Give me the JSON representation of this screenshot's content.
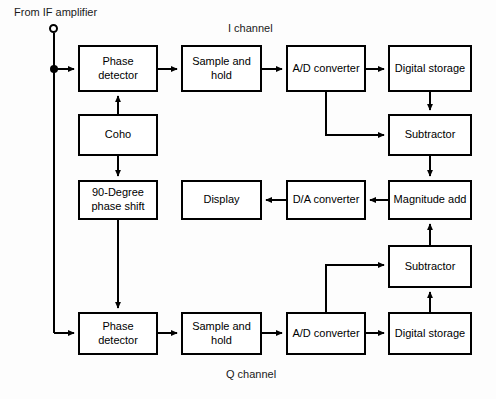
{
  "diagram": {
    "background_color": "#fdfdfd",
    "line_color": "#000000",
    "box_fill": "#ffffff",
    "text_color": "#000000",
    "source_label": "From IF amplifier",
    "channel_labels": {
      "i_channel": "I channel",
      "q_channel": "Q channel"
    },
    "nodes": [
      {
        "id": "phase_detector_i",
        "label": "Phase\ndetector",
        "x": 78,
        "y": 45,
        "w": 80,
        "h": 47
      },
      {
        "id": "sample_hold_i",
        "label": "Sample and\nhold",
        "x": 181,
        "y": 45,
        "w": 81,
        "h": 47
      },
      {
        "id": "ad_converter_i",
        "label": "A/D converter",
        "x": 286,
        "y": 45,
        "w": 80,
        "h": 47
      },
      {
        "id": "digital_storage_i",
        "label": "Digital storage",
        "x": 388,
        "y": 45,
        "w": 84,
        "h": 47
      },
      {
        "id": "coho",
        "label": "Coho",
        "x": 78,
        "y": 114,
        "w": 80,
        "h": 42
      },
      {
        "id": "subtractor_i",
        "label": "Subtractor",
        "x": 388,
        "y": 114,
        "w": 84,
        "h": 42
      },
      {
        "id": "phase_shift_90",
        "label": "90-Degree\nphase shift",
        "x": 78,
        "y": 180,
        "w": 80,
        "h": 40
      },
      {
        "id": "display",
        "label": "Display",
        "x": 181,
        "y": 180,
        "w": 81,
        "h": 40
      },
      {
        "id": "da_converter",
        "label": "D/A converter",
        "x": 286,
        "y": 180,
        "w": 80,
        "h": 40
      },
      {
        "id": "magnitude_add",
        "label": "Magnitude add",
        "x": 388,
        "y": 180,
        "w": 84,
        "h": 40
      },
      {
        "id": "subtractor_q",
        "label": "Subtractor",
        "x": 388,
        "y": 245,
        "w": 84,
        "h": 43
      },
      {
        "id": "phase_detector_q",
        "label": "Phase\ndetector",
        "x": 78,
        "y": 312,
        "w": 80,
        "h": 43
      },
      {
        "id": "sample_hold_q",
        "label": "Sample and\nhold",
        "x": 181,
        "y": 312,
        "w": 81,
        "h": 43
      },
      {
        "id": "ad_converter_q",
        "label": "A/D converter",
        "x": 286,
        "y": 312,
        "w": 80,
        "h": 43
      },
      {
        "id": "digital_storage_q",
        "label": "Digital storage",
        "x": 388,
        "y": 312,
        "w": 84,
        "h": 43
      }
    ],
    "terminal": {
      "label": "From IF amplifier",
      "cx": 54,
      "cy": 29
    },
    "junction": {
      "cx": 54,
      "cy": 69
    }
  }
}
